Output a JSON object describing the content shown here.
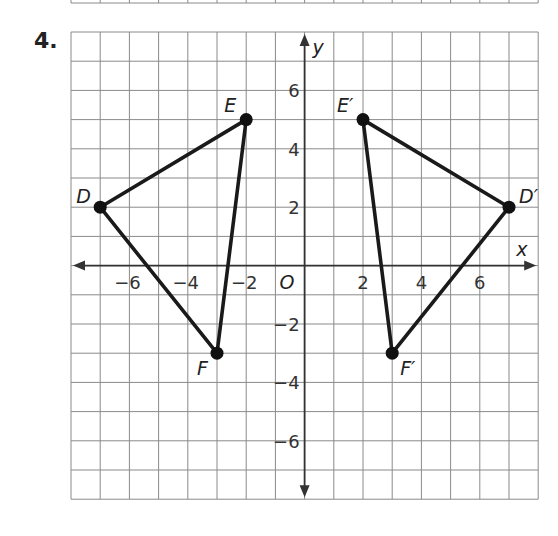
{
  "problem": {
    "number": "4."
  },
  "chart_data": {
    "type": "scatter",
    "title": "",
    "xlabel": "x",
    "ylabel": "y",
    "xlim": [
      -8,
      8
    ],
    "ylim": [
      -8,
      8
    ],
    "grid": true,
    "origin_label": "O",
    "x_ticks": [
      -6,
      -4,
      -2,
      2,
      4,
      6
    ],
    "x_tick_labels": [
      "−6",
      "−4",
      "−2",
      "2",
      "4",
      "6"
    ],
    "y_ticks": [
      6,
      4,
      2,
      -2,
      -4,
      -6
    ],
    "y_tick_labels": [
      "6",
      "4",
      "2",
      "−2",
      "−4",
      "−6"
    ],
    "series": [
      {
        "name": "Triangle DEF",
        "points": [
          {
            "label": "D",
            "x": -7,
            "y": 2
          },
          {
            "label": "E",
            "x": -2,
            "y": 5
          },
          {
            "label": "F",
            "x": -3,
            "y": -3
          }
        ]
      },
      {
        "name": "Triangle D'E'F'",
        "points": [
          {
            "label": "D′",
            "x": 7,
            "y": 2
          },
          {
            "label": "E′",
            "x": 2,
            "y": 5
          },
          {
            "label": "F′",
            "x": 3,
            "y": -3
          }
        ]
      }
    ]
  }
}
